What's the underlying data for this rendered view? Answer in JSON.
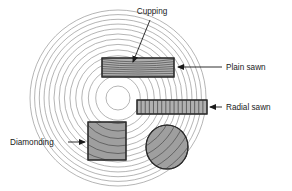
{
  "figure": {
    "background_color": "#ffffff",
    "width": 292,
    "height": 191
  },
  "log": {
    "center": {
      "x": 118,
      "y": 98
    },
    "outer_radius": 88,
    "ring_count": 14,
    "ring_color": "#8c8c8c",
    "pith_radius": 12,
    "pith_color": "#ffffff"
  },
  "labels": {
    "cupping": {
      "text": "Cupping",
      "x": 152,
      "y": 14,
      "anchor": "middle"
    },
    "plain_sawn": {
      "text": "Plain sawn",
      "x": 226,
      "y": 70,
      "anchor": "start"
    },
    "radial_sawn": {
      "text": "Radial sawn",
      "x": 226,
      "y": 110,
      "anchor": "start"
    },
    "diamonding": {
      "text": "Diamonding",
      "x": 10,
      "y": 145,
      "anchor": "start"
    }
  },
  "pieces": {
    "plain_sawn_board": {
      "name": "plain-sawn-board",
      "x": 102,
      "y": 58,
      "width": 72,
      "height": 19,
      "fill": "#b0b0b0",
      "stroke": "#2b2b2b",
      "grain": "curved-arcs"
    },
    "radial_sawn_board": {
      "name": "radial-sawn-board",
      "x": 137,
      "y": 100,
      "width": 70,
      "height": 14,
      "fill": "#b0b0b0",
      "stroke": "#2b2b2b",
      "grain": "vertical-lines",
      "grain_count": 17
    },
    "diamonding_square": {
      "name": "diamonding-square",
      "x": 88,
      "y": 122,
      "width": 38,
      "height": 38,
      "fill": "#9f9f9f",
      "stroke": "#2b2b2b",
      "grain": "diagonal-arcs"
    },
    "oval_piece": {
      "name": "oval-piece",
      "cx": 167,
      "cy": 147,
      "rx": 21,
      "ry": 22,
      "fill": "#9f9f9f",
      "stroke": "#2b2b2b",
      "grain": "diagonal-arcs"
    }
  },
  "leaders": {
    "cupping": {
      "from_x": 150,
      "from_y": 20,
      "to_x": 133,
      "to_y": 62,
      "arrow": "end"
    },
    "plain_sawn": {
      "from_x": 222,
      "from_y": 67,
      "to_x": 178,
      "to_y": 67,
      "arrow": "end"
    },
    "radial_sawn": {
      "from_x": 222,
      "from_y": 107,
      "to_x": 210,
      "to_y": 107,
      "arrow": "end"
    },
    "diamonding": {
      "from_x": 68,
      "from_y": 142,
      "to_x": 85,
      "to_y": 142,
      "arrow": "end"
    }
  }
}
